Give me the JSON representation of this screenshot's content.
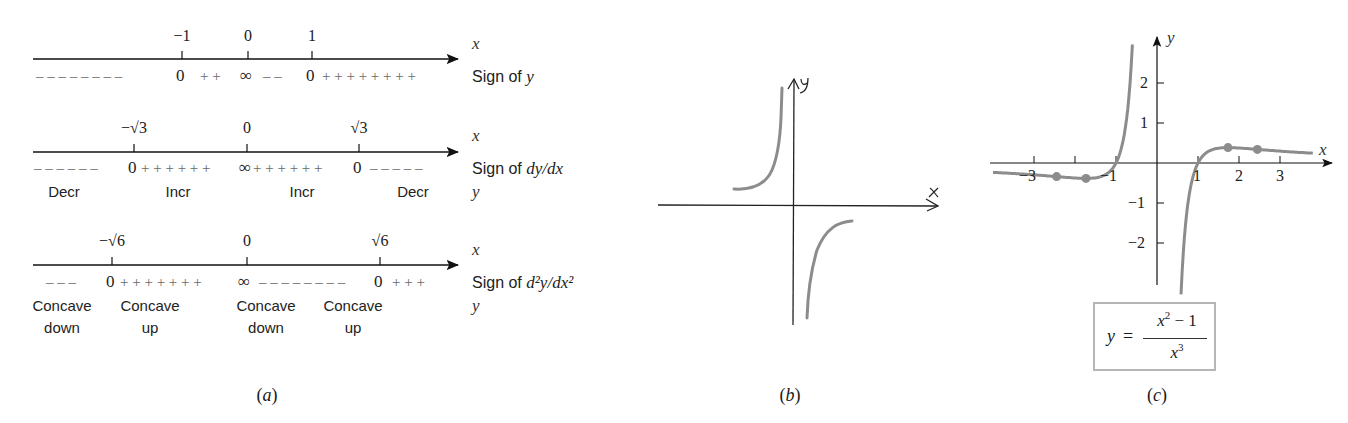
{
  "panel_a": {
    "caption": "a",
    "lines": [
      {
        "axis_var": "x",
        "ticks": [
          {
            "label": "−1",
            "x": 182
          },
          {
            "label": "0",
            "x": 248
          },
          {
            "label": "1",
            "x": 312
          }
        ],
        "row_label": "Sign of ",
        "row_label_var": "y",
        "signs": [
          {
            "text": "– – – – – – – –",
            "x": 36,
            "type": "minus"
          },
          {
            "text": "0",
            "x": 176,
            "type": "zero"
          },
          {
            "text": "+ +",
            "x": 200,
            "type": "plus"
          },
          {
            "text": "∞",
            "x": 240,
            "type": "zero"
          },
          {
            "text": "– –",
            "x": 263,
            "type": "minus"
          },
          {
            "text": "0",
            "x": 306,
            "type": "zero"
          },
          {
            "text": "+ + + + + + + +",
            "x": 322,
            "type": "plus"
          }
        ],
        "regions": []
      },
      {
        "axis_var": "x",
        "ticks": [
          {
            "label": "−√3",
            "x": 134
          },
          {
            "label": "0",
            "x": 247
          },
          {
            "label": "√3",
            "x": 359
          }
        ],
        "row_label": "Sign of ",
        "row_label_var": "dy/dx",
        "second_var": "y",
        "signs": [
          {
            "text": "– – – – – –",
            "x": 34,
            "type": "minus"
          },
          {
            "text": "0",
            "x": 128,
            "type": "zero"
          },
          {
            "text": "+ + + + + +",
            "x": 141,
            "type": "plus"
          },
          {
            "text": "∞",
            "x": 239,
            "type": "zero"
          },
          {
            "text": "+ + + + + +",
            "x": 253,
            "type": "plus"
          },
          {
            "text": "0",
            "x": 353,
            "type": "zero"
          },
          {
            "text": "– – – – –",
            "x": 370,
            "type": "minus"
          }
        ],
        "regions": [
          {
            "line1": "Decr",
            "x": 64
          },
          {
            "line1": "Incr",
            "x": 178
          },
          {
            "line1": "Incr",
            "x": 302
          },
          {
            "line1": "Decr",
            "x": 413
          }
        ]
      },
      {
        "axis_var": "x",
        "ticks": [
          {
            "label": "−√6",
            "x": 112
          },
          {
            "label": "0",
            "x": 247
          },
          {
            "label": "√6",
            "x": 380
          }
        ],
        "row_label": "Sign of ",
        "row_label_var": "d²y/dx²",
        "second_var": "y",
        "signs": [
          {
            "text": "– – –",
            "x": 46,
            "type": "minus"
          },
          {
            "text": "0",
            "x": 106,
            "type": "zero"
          },
          {
            "text": "+ + + + + + +",
            "x": 120,
            "type": "plus"
          },
          {
            "text": "∞",
            "x": 238,
            "type": "zero"
          },
          {
            "text": "– – – – – – – –",
            "x": 259,
            "type": "minus"
          },
          {
            "text": "0",
            "x": 374,
            "type": "zero"
          },
          {
            "text": "+ + +",
            "x": 392,
            "type": "plus"
          }
        ],
        "regions": [
          {
            "line1": "Concave",
            "line2": "down",
            "x": 62
          },
          {
            "line1": "Concave",
            "line2": "up",
            "x": 150
          },
          {
            "line1": "Concave",
            "line2": "down",
            "x": 266
          },
          {
            "line1": "Concave",
            "line2": "up",
            "x": 353
          }
        ]
      }
    ]
  },
  "panel_b": {
    "caption": "b",
    "x_axis_label": "x",
    "y_axis_label": "y",
    "description": "Hand-drawn sketch of y = (x²−1)/x³ near the origin: left branch rising toward +∞ as x→0⁻, right branch rising from −∞ as x→0⁺ toward a horizontal level below the x-axis"
  },
  "panel_c": {
    "caption": "c",
    "x_axis_label": "x",
    "y_axis_label": "y",
    "formula": {
      "lhs": "y",
      "eq": "=",
      "numerator_base": "x",
      "numerator_exp": "2",
      "numerator_rest": " − 1",
      "denominator_base": "x",
      "denominator_exp": "3"
    },
    "x_ticks": [
      "−3",
      "−1",
      "1",
      "2",
      "3"
    ],
    "y_ticks": [
      "2",
      "1",
      "−1",
      "−2"
    ]
  },
  "chart_data": {
    "type": "line",
    "xlabel": "x",
    "ylabel": "y",
    "xlim": [
      -4.0,
      4.2
    ],
    "ylim": [
      -3.0,
      3.2
    ],
    "x_ticks": [
      -3,
      -2,
      -1,
      1,
      2,
      3
    ],
    "x_tick_labels": [
      "−3",
      "",
      "−1",
      "1",
      "2",
      "3"
    ],
    "y_ticks": [
      -2,
      -1,
      1,
      2
    ],
    "grid": false,
    "series": [
      {
        "name": "left branch",
        "x": [
          -4.0,
          -3.0,
          -2.449,
          -2.0,
          -1.732,
          -1.5,
          -1.2,
          -1.0,
          -0.9,
          -0.8,
          -0.7,
          -0.6
        ],
        "y": [
          -0.234,
          -0.296,
          -0.34,
          -0.375,
          -0.385,
          -0.37,
          -0.255,
          0.0,
          0.261,
          0.703,
          1.487,
          2.963
        ]
      },
      {
        "name": "right branch",
        "x": [
          0.58,
          0.6,
          0.7,
          0.8,
          0.9,
          1.0,
          1.2,
          1.5,
          1.732,
          2.0,
          2.449,
          3.0,
          3.8
        ],
        "y": [
          -3.26,
          -2.963,
          -1.487,
          -0.703,
          -0.261,
          0.0,
          0.255,
          0.37,
          0.385,
          0.375,
          0.34,
          0.296,
          0.246
        ]
      }
    ],
    "marked_points": [
      {
        "x": -2.449,
        "y": -0.34,
        "label": "−√6 (inflection)"
      },
      {
        "x": -1.732,
        "y": -0.385,
        "label": "−√3 (local min)"
      },
      {
        "x": 1.732,
        "y": 0.385,
        "label": "√3 (local max)"
      },
      {
        "x": 2.449,
        "y": 0.34,
        "label": "√6 (inflection)"
      }
    ],
    "colors": {
      "curve": "#8c8c8c",
      "axis": "#1a1a1a",
      "points": "#8c8c8c"
    }
  }
}
